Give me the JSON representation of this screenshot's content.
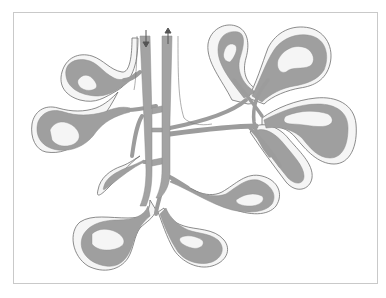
{
  "diagram": {
    "colors": {
      "vessel_fill": "#9f9f9f",
      "capsule_fill": "#f5f5f5",
      "outline": "#6f6f6f",
      "frame": "#c9c9c9",
      "background": "#ffffff"
    },
    "flow_arrows": [
      {
        "name": "inflow",
        "direction": "down"
      },
      {
        "name": "outflow",
        "direction": "up"
      }
    ],
    "lobes": [
      "upper-left",
      "left",
      "lower-left-small",
      "bottom-left",
      "bottom-center",
      "center-right",
      "upper-right-top",
      "upper-right",
      "right"
    ]
  }
}
